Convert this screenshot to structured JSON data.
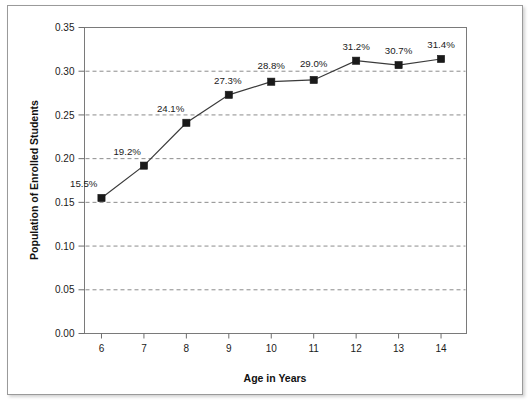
{
  "chart_data": {
    "type": "line",
    "title": "",
    "xlabel": "Age in Years",
    "ylabel": "Population of Enrolled Students",
    "categories": [
      6,
      7,
      8,
      9,
      10,
      11,
      12,
      13,
      14
    ],
    "x_tick_labels": [
      "6",
      "7",
      "8",
      "9",
      "10",
      "11",
      "12",
      "13",
      "14"
    ],
    "values": [
      0.155,
      0.192,
      0.241,
      0.273,
      0.288,
      0.29,
      0.312,
      0.307,
      0.314
    ],
    "point_labels": [
      "15.5%",
      "19.2%",
      "24.1%",
      "27.3%",
      "28.8%",
      "29.0%",
      "31.2%",
      "30.7%",
      "31.4%"
    ],
    "y_tick_values": [
      0.0,
      0.05,
      0.1,
      0.15,
      0.2,
      0.25,
      0.3,
      0.35
    ],
    "y_tick_labels": [
      "0.00",
      "0.05",
      "0.10",
      "0.15",
      "0.20",
      "0.25",
      "0.30",
      "0.35"
    ],
    "ylim": [
      0.0,
      0.35
    ],
    "xlim": [
      5.6,
      14.6
    ],
    "grid": "horizontal-dashed",
    "legend": "none",
    "series_color": "#1a1a1a",
    "marker": "square",
    "gridline_color": "#8c8c8c",
    "axis_color": "#6e6e6e",
    "background_color": "#ffffff"
  },
  "axis": {
    "x_title": "Age in Years",
    "y_title": "Population of Enrolled Students"
  }
}
